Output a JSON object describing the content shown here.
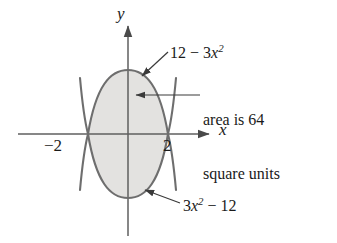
{
  "figure": {
    "background_color": "#ffffff",
    "curve_color": "#6e6e6e",
    "fill_color": "#e3e2e0",
    "axis_color": "#5f5f5f",
    "leader_color": "#3a3a3a",
    "text_color": "#1a1a1a"
  },
  "axes": {
    "x_label": "x",
    "y_label": "y",
    "origin": {
      "x": 128,
      "y": 134
    },
    "x_range_px": [
      18,
      213
    ],
    "y_range_px": [
      22,
      236
    ],
    "ticks": [
      {
        "name": "tick-neg2",
        "label": "−2",
        "x_value": -2,
        "x_px": 88
      },
      {
        "name": "tick-pos2",
        "label": "2",
        "x_value": 2,
        "x_px": 168
      }
    ]
  },
  "curves": [
    {
      "name": "upper-parabola",
      "label_text": "12 − 3x",
      "label_exponent": "2",
      "expression": "12 - 3x^2",
      "opens": "down",
      "vertex": {
        "x": 0,
        "y": 12
      },
      "roots": [
        -2,
        2
      ]
    },
    {
      "name": "lower-parabola",
      "label_text": "3x",
      "label_exponent": "2",
      "label_tail": " − 12",
      "expression": "3x^2 - 12",
      "opens": "up",
      "vertex": {
        "x": 0,
        "y": -12
      },
      "roots": [
        -2,
        2
      ]
    }
  ],
  "annotations": {
    "area_note_line1": "area is 64",
    "area_note_line2": "square units",
    "area_value": 64,
    "area_units": "square units"
  },
  "chart_data": {
    "type": "line",
    "title": "",
    "xlabel": "x",
    "ylabel": "y",
    "xlim": [
      -3.2,
      3.2
    ],
    "ylim": [
      -16,
      16
    ],
    "grid": false,
    "legend": "none",
    "shaded_region": {
      "between": [
        "12 - 3x^2",
        "3x^2 - 12"
      ],
      "from_x": -2,
      "to_x": 2,
      "area": 64,
      "area_units": "square units",
      "fill_color": "#e3e2e0"
    },
    "series": [
      {
        "name": "12 - 3x^2",
        "x": [
          -3,
          -2.5,
          -2,
          -1.5,
          -1,
          -0.5,
          0,
          0.5,
          1,
          1.5,
          2,
          2.5,
          3
        ],
        "values": [
          -15,
          -6.75,
          0,
          5.25,
          9,
          11.25,
          12,
          11.25,
          9,
          5.25,
          0,
          -6.75,
          -15
        ]
      },
      {
        "name": "3x^2 - 12",
        "x": [
          -3,
          -2.5,
          -2,
          -1.5,
          -1,
          -0.5,
          0,
          0.5,
          1,
          1.5,
          2,
          2.5,
          3
        ],
        "values": [
          15,
          6.75,
          0,
          -5.25,
          -9,
          -11.25,
          -12,
          -11.25,
          -9,
          -5.25,
          0,
          6.75,
          15
        ]
      }
    ],
    "annotations": [
      {
        "text": "12 - 3x^2",
        "points_to": "upper curve"
      },
      {
        "text": "3x^2 - 12",
        "points_to": "lower curve"
      },
      {
        "text": "area is 64 square units",
        "points_to": "shaded region"
      }
    ]
  }
}
